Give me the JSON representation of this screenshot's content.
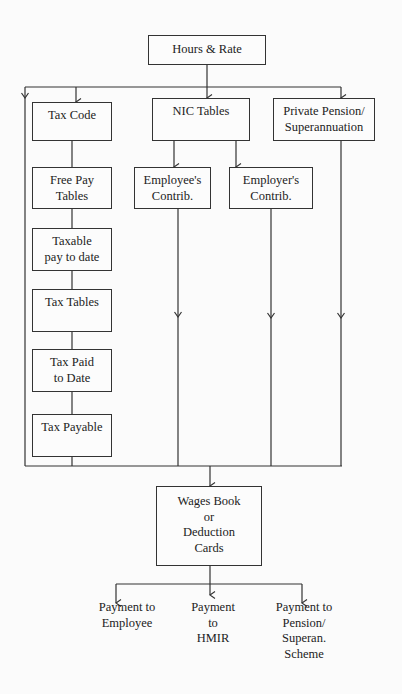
{
  "diagram": {
    "type": "payroll-flowchart",
    "source": {
      "id": "hours-rate",
      "lines": [
        "Hours & Rate"
      ]
    },
    "columns": {
      "tax": [
        {
          "id": "tax-code",
          "lines": [
            "Tax Code"
          ]
        },
        {
          "id": "free-pay-tables",
          "lines": [
            "Free Pay",
            "Tables"
          ]
        },
        {
          "id": "taxable-pay",
          "lines": [
            "Taxable",
            "pay to date"
          ]
        },
        {
          "id": "tax-tables",
          "lines": [
            "Tax Tables"
          ]
        },
        {
          "id": "tax-paid",
          "lines": [
            "Tax Paid",
            "to Date"
          ]
        },
        {
          "id": "tax-payable",
          "lines": [
            "Tax Payable"
          ]
        }
      ],
      "nic": {
        "head": {
          "id": "nic-tables",
          "lines": [
            "NIC Tables"
          ]
        },
        "children": [
          {
            "id": "employee-contrib",
            "lines": [
              "Employee's",
              "Contrib."
            ]
          },
          {
            "id": "employer-contrib",
            "lines": [
              "Employer's",
              "Contrib."
            ]
          }
        ]
      },
      "pension": {
        "id": "private-pension",
        "lines": [
          "Private Pension/",
          "Superannuation"
        ]
      }
    },
    "sink": {
      "id": "wages-book",
      "lines": [
        "Wages Book",
        "or",
        "Deduction",
        "Cards"
      ]
    },
    "outputs": [
      {
        "id": "payment-employee",
        "lines": [
          "Payment to",
          "Employee"
        ]
      },
      {
        "id": "payment-hmir",
        "lines": [
          "Payment",
          "to",
          "HMIR"
        ]
      },
      {
        "id": "payment-pension",
        "lines": [
          "Payment to",
          "Pension/",
          "Superan.",
          "Scheme"
        ]
      }
    ]
  }
}
